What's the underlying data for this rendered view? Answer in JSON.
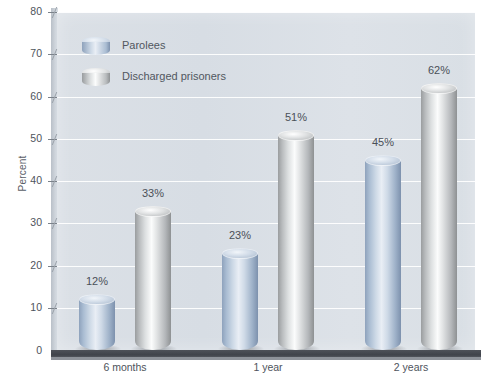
{
  "chart_data": {
    "type": "bar",
    "title": "",
    "subtitle": "",
    "xlabel": "",
    "ylabel": "Percent",
    "categories": [
      "6 months",
      "1 year",
      "2 years"
    ],
    "series": [
      {
        "name": "Parolees",
        "color": "#a9bcd2",
        "values": [
          12,
          23,
          45
        ],
        "labels": [
          "12%",
          "23%",
          "45%"
        ]
      },
      {
        "name": "Discharged prisoners",
        "color": "#c9ccce",
        "values": [
          33,
          51,
          62
        ],
        "labels": [
          "33%",
          "51%",
          "62%"
        ]
      }
    ],
    "ylim": [
      0,
      80
    ],
    "ytick_step": 10,
    "ytick_labels": [
      "80",
      "70",
      "60",
      "50",
      "40",
      "30",
      "20",
      "10",
      "0"
    ],
    "ytick_values": [
      80,
      70,
      60,
      50,
      40,
      30,
      20,
      10,
      0
    ],
    "grid": true,
    "grid_color": "#ffffff",
    "legend_position": "top-left",
    "plot_background": "#d9dfe5",
    "floor_color": "#45494f",
    "style": "3d-cylinder"
  },
  "legend": {
    "items": [
      {
        "label": "Parolees",
        "swatch": "blue-cylinder-icon"
      },
      {
        "label": "Discharged prisoners",
        "swatch": "silver-cylinder-icon"
      }
    ]
  },
  "axis": {
    "y_title": "Percent"
  }
}
